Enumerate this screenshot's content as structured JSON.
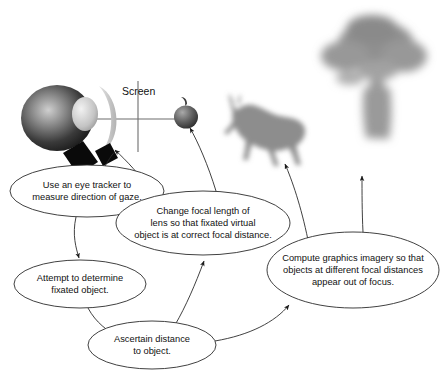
{
  "figure": {
    "background_color": "#ffffff",
    "line_color": "#2b2b2b",
    "text_color": "#111111"
  },
  "scene": {
    "screen_label": "Screen",
    "axis_color": "#6d6d6d",
    "eye": {
      "name": "eye",
      "body_color_dark": "#1d1d1d",
      "body_color_light": "#d7d7d7",
      "cornea_color": "#e8e8e8"
    },
    "lens": {
      "name": "adaptive-lens",
      "color": "#c9c9c9"
    },
    "eye_tracker": {
      "name": "eye-tracker-camera",
      "color": "#0a0a0a"
    },
    "objects": [
      {
        "name": "apple",
        "focus": "in-focus",
        "color": "#5b5b5b",
        "blur_px": 0
      },
      {
        "name": "deer",
        "focus": "out-of-focus",
        "color": "#8d8d8d",
        "blur_px": 2.4
      },
      {
        "name": "tree",
        "focus": "out-of-focus",
        "color": "#9a9a9a",
        "blur_px": 4.5
      }
    ]
  },
  "nodes": [
    {
      "id": "eye-tracker-node",
      "lines": [
        "Use an eye tracker to",
        "measure direction of gaze."
      ],
      "cx": 87,
      "cy": 191,
      "rx": 77,
      "ry": 26
    },
    {
      "id": "fixated-object-node",
      "lines": [
        "Attempt to determine",
        "fixated object."
      ],
      "cx": 80,
      "cy": 284,
      "rx": 66,
      "ry": 24
    },
    {
      "id": "ascertain-distance-node",
      "lines": [
        "Ascertain distance",
        "to object."
      ],
      "cx": 152,
      "cy": 345,
      "rx": 64,
      "ry": 24
    },
    {
      "id": "focal-length-node",
      "lines": [
        "Change focal length of",
        "lens so that fixated virtual",
        "object is at correct focal distance."
      ],
      "cx": 203,
      "cy": 223,
      "rx": 87,
      "ry": 32
    },
    {
      "id": "compute-graphics-node",
      "lines": [
        "Compute graphics imagery so that",
        "objects at different focal distances",
        "appear out of focus."
      ],
      "cx": 353,
      "cy": 270,
      "rx": 86,
      "ry": 38
    }
  ],
  "edges": [
    {
      "id": "edge-tracker-to-camera",
      "from": "eye-tracker-node",
      "to": "eye-tracker-camera",
      "arrow": false
    },
    {
      "id": "edge-tracker-to-fixated",
      "from": "eye-tracker-node",
      "to": "fixated-object-node",
      "arrow": true
    },
    {
      "id": "edge-fixated-to-ascertain",
      "from": "fixated-object-node",
      "to": "ascertain-distance-node",
      "arrow": true
    },
    {
      "id": "edge-ascertain-to-focal",
      "from": "ascertain-distance-node",
      "to": "focal-length-node",
      "arrow": true
    },
    {
      "id": "edge-ascertain-to-compute",
      "from": "ascertain-distance-node",
      "to": "compute-graphics-node",
      "arrow": true
    },
    {
      "id": "edge-focal-to-lens",
      "from": "focal-length-node",
      "to": "adaptive-lens",
      "arrow": true
    },
    {
      "id": "edge-focal-to-apple",
      "from": "focal-length-node",
      "to": "apple",
      "arrow": true
    },
    {
      "id": "edge-compute-to-deer",
      "from": "compute-graphics-node",
      "to": "deer",
      "arrow": true
    },
    {
      "id": "edge-compute-to-tree",
      "from": "compute-graphics-node",
      "to": "tree",
      "arrow": true
    }
  ]
}
